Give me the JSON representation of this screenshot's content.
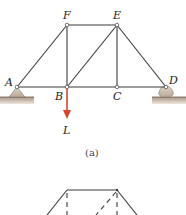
{
  "figure": {
    "joints": {
      "A": "A",
      "B": "B",
      "C": "C",
      "D": "D",
      "E": "E",
      "F": "F"
    },
    "load_label": "L",
    "caption": "(a)",
    "colors": {
      "member": "#3a3a3a",
      "load_arrow": "#d9452b",
      "support": "#cbbcae",
      "ground": "#c8b8aa"
    }
  }
}
